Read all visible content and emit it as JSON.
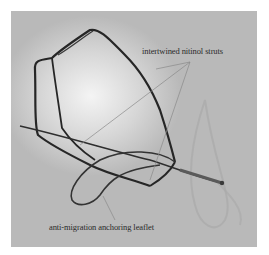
{
  "figure": {
    "annotations": [
      {
        "id": "struts",
        "label": "intertwined nitinol struts"
      },
      {
        "id": "leaflet",
        "label": "anti-migration anchoring leaflet"
      }
    ],
    "colors": {
      "background": "#ffffff",
      "photo_bg": "#c4c4c4",
      "wire": "#2a2a2a",
      "pointer_line": "#8a8a8a",
      "label_text": "#2a2a2a"
    }
  }
}
